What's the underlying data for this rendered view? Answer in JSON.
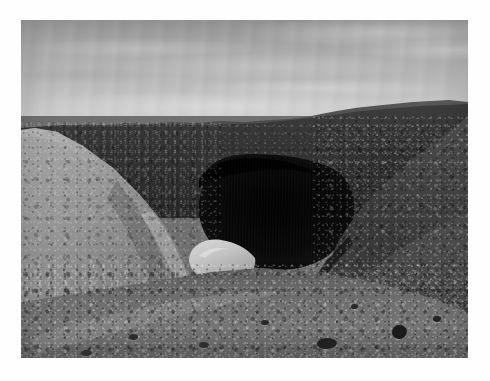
{
  "image": {
    "kind": "photograph",
    "medium": "black-and-white photographic print",
    "orientation": "landscape",
    "border": {
      "style": "white mat border",
      "color": "#ffffff",
      "top_px": 20,
      "left_px": 21,
      "right_px": 22,
      "bottom_px": 23
    },
    "photo_area": {
      "x": 21,
      "y": 20,
      "width": 447,
      "height": 338
    }
  },
  "scene": {
    "subject": "desert quarry gorge with dark shadowed pit",
    "time_of_day": "daylight, overcast-bright",
    "palette": {
      "sky_top": "#9b9b9b",
      "sky_horizon": "#c8c8c8",
      "far_hills": "#4a4a4a",
      "mid_plateau": "#3a3a3a",
      "left_slope": "#8c8c8c",
      "right_slope": "#3e3e3e",
      "foreground_gravel": "#6f6f6f",
      "gorge_shadow": "#0c0c0c",
      "bright_outcrop": "#c4c4c4"
    }
  },
  "regions": [
    {
      "name": "sky",
      "label": "Overcast sky with soft horizontal cloud banding",
      "bounds": {
        "x": 0,
        "y": 0,
        "width": 447,
        "height": 96
      },
      "tone": "light grey, brightening toward the horizon"
    },
    {
      "name": "far-hills",
      "label": "Dark distant ridge line across the horizon",
      "bounds": {
        "x": 0,
        "y": 66,
        "width": 447,
        "height": 70
      },
      "tone": "dark grey silhouette"
    },
    {
      "name": "mid-plateau",
      "label": "Mid-ground dark scrub-covered plateau",
      "bounds": {
        "x": 0,
        "y": 78,
        "width": 447,
        "height": 120
      },
      "tone": "dark textured"
    },
    {
      "name": "gorge",
      "label": "Deep black shadowed gorge / quarry pit at centre",
      "bounds": {
        "x": 150,
        "y": 124,
        "width": 190,
        "height": 140
      },
      "tone": "near-black with faint vertical rock striations"
    },
    {
      "name": "left-slope",
      "label": "Pale gravelly scree slope descending from the left",
      "bounds": {
        "x": 0,
        "y": 96,
        "width": 230,
        "height": 242
      },
      "tone": "mid-light grey, coarse gravel texture"
    },
    {
      "name": "right-slope",
      "label": "Dark rocky rubble bank on the right",
      "bounds": {
        "x": 292,
        "y": 96,
        "width": 155,
        "height": 200
      },
      "tone": "dark grey, boulder strewn"
    },
    {
      "name": "bright-outcrop",
      "label": "Bright pale rock outcrop at the base of the gorge",
      "bounds": {
        "x": 164,
        "y": 216,
        "width": 74,
        "height": 48
      },
      "tone": "highlight, lightest stone in the frame"
    },
    {
      "name": "foreground",
      "label": "Stony gravel floor in the foreground",
      "bounds": {
        "x": 0,
        "y": 238,
        "width": 447,
        "height": 100
      },
      "tone": "mid grey with scattered dark stones"
    }
  ],
  "rocks": [
    {
      "name": "foreground-boulder-left",
      "x": 296,
      "y": 318,
      "w": 20,
      "h": 11,
      "tone": "#262626"
    },
    {
      "name": "foreground-boulder-right",
      "x": 371,
      "y": 305,
      "w": 15,
      "h": 14,
      "tone": "#1f1f1f"
    },
    {
      "name": "foreground-stone-a",
      "x": 178,
      "y": 322,
      "w": 10,
      "h": 6,
      "tone": "#333333"
    },
    {
      "name": "foreground-stone-b",
      "x": 240,
      "y": 300,
      "w": 8,
      "h": 5,
      "tone": "#2c2c2c"
    },
    {
      "name": "foreground-stone-c",
      "x": 108,
      "y": 314,
      "w": 9,
      "h": 6,
      "tone": "#303030"
    },
    {
      "name": "foreground-stone-d",
      "x": 330,
      "y": 284,
      "w": 7,
      "h": 5,
      "tone": "#2a2a2a"
    },
    {
      "name": "foreground-stone-e",
      "x": 412,
      "y": 296,
      "w": 8,
      "h": 6,
      "tone": "#262626"
    },
    {
      "name": "foreground-stone-f",
      "x": 60,
      "y": 330,
      "w": 11,
      "h": 6,
      "tone": "#353535"
    }
  ]
}
